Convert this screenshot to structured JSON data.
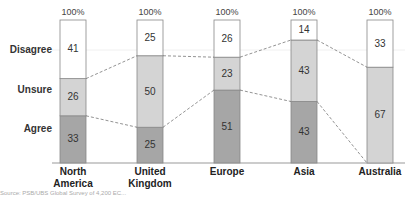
{
  "chart_data": {
    "type": "bar",
    "stacked": true,
    "normalized": true,
    "title": "",
    "xlabel": "",
    "ylabel": "",
    "ylim": [
      0,
      100
    ],
    "categories": [
      "North America",
      "United Kingdom",
      "Europe",
      "Asia",
      "Australia"
    ],
    "category_lines": [
      [
        "North",
        "America"
      ],
      [
        "United",
        "Kingdom"
      ],
      [
        "Europe"
      ],
      [
        "Asia"
      ],
      [
        "Australia"
      ]
    ],
    "top_labels": [
      "100%",
      "100%",
      "100%",
      "100%",
      "100%"
    ],
    "series": [
      {
        "name": "Agree",
        "color": "#a6a6a6",
        "values": [
          33,
          25,
          51,
          43,
          0
        ]
      },
      {
        "name": "Unsure",
        "color": "#d4d4d4",
        "values": [
          26,
          50,
          23,
          43,
          67
        ]
      },
      {
        "name": "Disagree",
        "color": "#ffffff",
        "values": [
          41,
          25,
          26,
          14,
          33
        ]
      }
    ],
    "row_labels": [
      "Disagree",
      "Unsure",
      "Agree"
    ],
    "connector_lines": "dashed",
    "grid": false,
    "legend": "row labels on left"
  },
  "source_note": "Source: PSB/UBS Global Survey of 4,200 EC..."
}
